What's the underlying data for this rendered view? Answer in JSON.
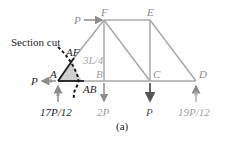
{
  "figure": {
    "caption": "(a)",
    "section_label": "Section cut",
    "dimension_label": "3L/4",
    "colors": {
      "member": "#a8a8a8",
      "dark_member": "#1a1a1a",
      "free_body_fill": "#cfcfcf",
      "label_gray": "#9a9a9a",
      "label_dark": "#1f1f1f",
      "arrow_gray": "#8c8c8c"
    },
    "nodes": [
      {
        "id": "A",
        "label": "A"
      },
      {
        "id": "B",
        "label": "B"
      },
      {
        "id": "C",
        "label": "C"
      },
      {
        "id": "D",
        "label": "D"
      },
      {
        "id": "E",
        "label": "E"
      },
      {
        "id": "F",
        "label": "F"
      }
    ],
    "member_forces": [
      {
        "id": "AF",
        "label": "AF"
      },
      {
        "id": "AB",
        "label": "AB"
      }
    ],
    "loads": [
      {
        "id": "load-F",
        "label": "P",
        "direction": "right"
      },
      {
        "id": "load-A",
        "label": "P",
        "direction": "left"
      },
      {
        "id": "load-B",
        "label": "2P",
        "direction": "down"
      },
      {
        "id": "load-C",
        "label": "P",
        "direction": "down"
      }
    ],
    "reactions": [
      {
        "id": "reaction-A",
        "label": "17P/12",
        "direction": "up"
      },
      {
        "id": "reaction-D",
        "label": "19P/12",
        "direction": "up"
      }
    ]
  }
}
